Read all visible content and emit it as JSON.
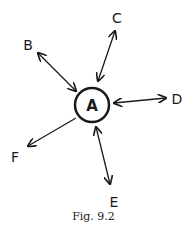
{
  "diagram": {
    "center_node": {
      "label": "A"
    },
    "nodes": [
      {
        "id": "B",
        "label": "B",
        "relation": "bidirectional"
      },
      {
        "id": "C",
        "label": "C",
        "relation": "bidirectional"
      },
      {
        "id": "D",
        "label": "D",
        "relation": "bidirectional"
      },
      {
        "id": "E",
        "label": "E",
        "relation": "bidirectional"
      },
      {
        "id": "F",
        "label": "F",
        "relation": "outgoing"
      }
    ],
    "caption": "Fig. 9.2",
    "colors": {
      "ink": "#1a1a1a",
      "background": "#ffffff"
    }
  }
}
